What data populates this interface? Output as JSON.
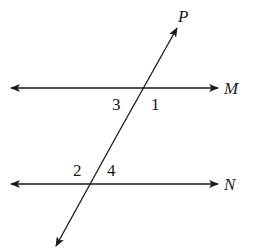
{
  "diagram": {
    "lines": [
      {
        "name": "M",
        "label": "M",
        "type": "horizontal"
      },
      {
        "name": "N",
        "label": "N",
        "type": "horizontal"
      },
      {
        "name": "P",
        "label": "P",
        "type": "transversal"
      }
    ],
    "angles": [
      {
        "label": "1",
        "position": "below-right of M intersection"
      },
      {
        "label": "3",
        "position": "below-left of M intersection"
      },
      {
        "label": "2",
        "position": "above-left of N intersection"
      },
      {
        "label": "4",
        "position": "above-right of N intersection"
      }
    ],
    "colors": {
      "stroke": "#1a1a1a",
      "background": "#ffffff"
    }
  }
}
